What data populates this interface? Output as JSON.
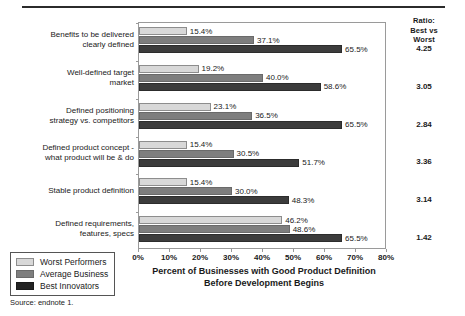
{
  "chart_data": {
    "type": "bar",
    "orientation": "horizontal",
    "title": "",
    "xlabel": "Percent of Businesses with Good Product Definition Before Development Begins",
    "ylabel": "",
    "xlim": [
      0,
      80
    ],
    "grid": false,
    "legend_position": "bottom-left",
    "categories": [
      "Benefits to be delivered clearly defined",
      "Well-defined target market",
      "Defined positioning strategy vs. competitors",
      "Defined product concept - what product will be & do",
      "Stable product definition",
      "Defined requirements, features, specs"
    ],
    "category_lines": [
      [
        "Benefits to be delivered",
        "clearly defined"
      ],
      [
        "Well-defined target",
        "market"
      ],
      [
        "Defined positioning",
        "strategy vs. competitors"
      ],
      [
        "Defined product concept -",
        "what product will be & do"
      ],
      [
        "Stable product definition"
      ],
      [
        "Defined requirements,",
        "features, specs"
      ]
    ],
    "series": [
      {
        "name": "Worst Performers",
        "color": "#d8d8d8",
        "values": [
          15.4,
          19.2,
          23.1,
          15.4,
          15.4,
          46.2
        ],
        "labels": [
          "15.4%",
          "19.2%",
          "23.1%",
          "15.4%",
          "15.4%",
          "46.2%"
        ]
      },
      {
        "name": "Average Business",
        "color": "#7e7e7e",
        "values": [
          37.1,
          40.0,
          36.5,
          30.5,
          30.0,
          48.6
        ],
        "labels": [
          "37.1%",
          "40.0%",
          "36.5%",
          "30.5%",
          "30.0%",
          "48.6%"
        ]
      },
      {
        "name": "Best Innovators",
        "color": "#3c3c3c",
        "values": [
          65.5,
          58.6,
          65.5,
          51.7,
          48.3,
          65.5
        ],
        "labels": [
          "65.5%",
          "58.6%",
          "65.5%",
          "51.7%",
          "48.3%",
          "65.5%"
        ]
      }
    ],
    "xticks": [
      0,
      10,
      20,
      30,
      40,
      50,
      60,
      70,
      80
    ],
    "xtick_labels": [
      "0%",
      "10%",
      "20%",
      "30%",
      "40%",
      "50%",
      "60%",
      "70%",
      "80%"
    ]
  },
  "axis_title": {
    "line1": "Percent of Businesses with Good Product Definition",
    "line2": "Before Development Begins"
  },
  "ratio_column": {
    "header_lines": [
      "Ratio:",
      "Best vs",
      "Worst"
    ],
    "values": [
      "4.25",
      "3.05",
      "2.84",
      "3.36",
      "3.14",
      "1.42"
    ]
  },
  "legend": {
    "items": [
      {
        "label": "Worst Performers",
        "swatch": "worst"
      },
      {
        "label": "Average Business",
        "swatch": "average"
      },
      {
        "label": "Best Innovators",
        "swatch": "best"
      }
    ]
  },
  "source": {
    "text": "Source: endnote 1."
  }
}
